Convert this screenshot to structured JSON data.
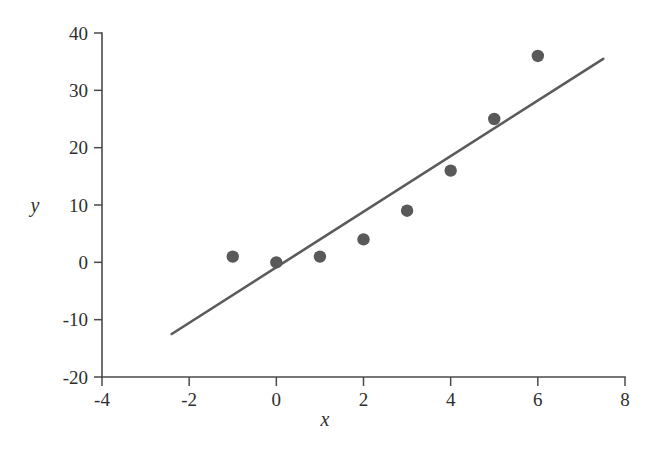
{
  "chart_data": {
    "type": "scatter",
    "title": "",
    "subtitle": "",
    "xlabel": "x",
    "ylabel": "y",
    "xlim": [
      -4,
      8
    ],
    "ylim": [
      -20,
      40
    ],
    "xticks": [
      -4,
      -2,
      0,
      2,
      4,
      6,
      8
    ],
    "yticks": [
      -20,
      -10,
      0,
      10,
      20,
      30,
      40
    ],
    "xtick_labels": [
      "-4",
      "-2",
      "0",
      "2",
      "4",
      "6",
      "8"
    ],
    "ytick_labels": [
      "-20",
      "-10",
      "0",
      "10",
      "20",
      "30",
      "40"
    ],
    "grid": false,
    "legend": null,
    "legend_position": "none",
    "point_color": "#595959",
    "line_color": "#5b5b5b",
    "axis_color": "#4a4a4a",
    "background_color": "#ffffff",
    "series": [
      {
        "name": "observations",
        "type": "scatter",
        "marker": "filled-circle",
        "x": [
          -1,
          0,
          1,
          2,
          3,
          4,
          5,
          6
        ],
        "y": [
          1,
          0,
          1,
          4,
          9,
          16,
          25,
          36
        ],
        "points": [
          {
            "x": -1,
            "y": 1
          },
          {
            "x": 0,
            "y": 0
          },
          {
            "x": 1,
            "y": 1
          },
          {
            "x": 2,
            "y": 4
          },
          {
            "x": 3,
            "y": 9
          },
          {
            "x": 4,
            "y": 16
          },
          {
            "x": 5,
            "y": 25
          },
          {
            "x": 6,
            "y": 36
          }
        ]
      },
      {
        "name": "fitted-line",
        "type": "line",
        "x": [
          -2.4,
          7.5
        ],
        "y": [
          -12.5,
          35.5
        ],
        "slope": 4.85,
        "intercept": -0.86
      }
    ],
    "annotations": []
  },
  "figure": {
    "axis_title_x": "x",
    "axis_title_y": "y"
  }
}
